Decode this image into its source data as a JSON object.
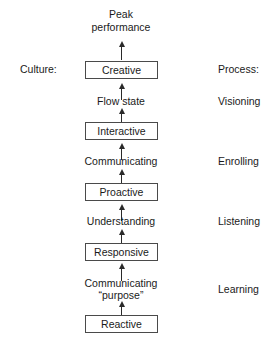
{
  "diagram": {
    "title_top": "Peak\nperformance",
    "top_line1": "Peak",
    "top_line2": "performance",
    "column_headers": {
      "left": "Culture:",
      "right": "Process:"
    },
    "stages": [
      {
        "box": "Creative",
        "transition_in": "Flow state",
        "process": "Visioning"
      },
      {
        "box": "Interactive",
        "transition_in": "Communicating",
        "process": "Enrolling"
      },
      {
        "box": "Proactive",
        "transition_in": "Understanding",
        "process": "Listening"
      },
      {
        "box": "Responsive",
        "transition_in": "Communicating\n\"purpose\"",
        "process": "Learning"
      },
      {
        "box": "Reactive",
        "transition_in": "",
        "process": ""
      }
    ],
    "boxes": {
      "creative": "Creative",
      "interactive": "Interactive",
      "proactive": "Proactive",
      "responsive": "Responsive",
      "reactive": "Reactive"
    },
    "transitions": {
      "flow_state": "Flow state",
      "communicating": "Communicating",
      "understanding": "Understanding",
      "communicating_purpose_line1": "Communicating",
      "communicating_purpose_line2": "“purpose”"
    },
    "process_labels": {
      "visioning": "Visioning",
      "enrolling": "Enrolling",
      "listening": "Listening",
      "learning": "Learning"
    },
    "colors": {
      "ink": "#1a1a1a",
      "box_border": "#4a4a4a",
      "arrow": "#2a2a2a",
      "background": "#ffffff"
    }
  }
}
